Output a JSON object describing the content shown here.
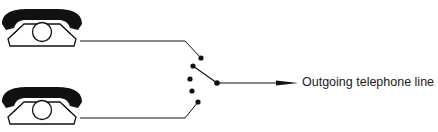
{
  "diagram": {
    "type": "telephone-switch-schematic",
    "phones": [
      {
        "id": "phone-1",
        "position": "top"
      },
      {
        "id": "phone-2",
        "position": "bottom"
      }
    ],
    "switch": {
      "contacts": 5,
      "selected_contact": 2
    },
    "output_label": "Outgoing telephone line",
    "colors": {
      "ink": "#111111",
      "background": "#ffffff"
    }
  }
}
